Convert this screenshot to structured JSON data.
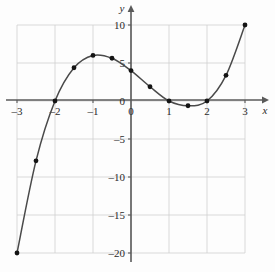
{
  "chart_data": {
    "type": "line",
    "title": "",
    "subtitle": "",
    "xlabel": "x",
    "ylabel": "y",
    "xlim": [
      -3,
      3
    ],
    "ylim": [
      -20,
      10
    ],
    "grid": true,
    "legend": false,
    "legend_position": "none",
    "x_ticks": [
      -3,
      -2,
      -1,
      0,
      1,
      2,
      3
    ],
    "x_tick_labels": [
      "–3",
      "–2",
      "–1",
      "0",
      "1",
      "2",
      "3"
    ],
    "y_ticks": [
      10,
      5,
      0,
      -5,
      -10,
      -15,
      -20
    ],
    "y_tick_labels": [
      "10",
      "5",
      "0",
      "–5",
      "–10",
      "–15",
      "–20"
    ],
    "y_zero_label_hidden": false,
    "x_gridlines": [
      -3,
      -2,
      -1,
      0,
      1,
      2,
      3
    ],
    "y_gridlines": [
      10,
      5,
      0,
      -5,
      -10,
      -15,
      -20
    ],
    "series": [
      {
        "name": "cubic-curve",
        "type": "line",
        "color": "#4a4a4a",
        "marker": "circle",
        "marker_color": "#141414",
        "x": [
          -3,
          -2.5,
          -2,
          -1.5,
          -1,
          -0.5,
          0,
          0.5,
          1,
          1.5,
          2,
          2.5,
          3
        ],
        "y": [
          -20,
          -7.875,
          0,
          4.375,
          6,
          5.625,
          4,
          1.875,
          0,
          -0.625,
          0,
          3.375,
          10
        ]
      }
    ],
    "marked_points": [
      {
        "x": -3,
        "y": -20
      },
      {
        "x": -2.5,
        "y": -7.875
      },
      {
        "x": -2,
        "y": 0
      },
      {
        "x": -1.5,
        "y": 4.375
      },
      {
        "x": -1,
        "y": 6
      },
      {
        "x": -0.5,
        "y": 5.625
      },
      {
        "x": 0,
        "y": 4
      },
      {
        "x": 0.5,
        "y": 1.875
      },
      {
        "x": 1,
        "y": 0
      },
      {
        "x": 1.5,
        "y": -0.625
      },
      {
        "x": 2,
        "y": 0
      },
      {
        "x": 2.5,
        "y": 3.375
      },
      {
        "x": 3,
        "y": 10
      }
    ],
    "annotations": []
  },
  "style": {
    "background": "#fdfdfd",
    "grid_color": "#cfcfcf",
    "axis_color": "#5a5a5a",
    "curve_color": "#4a4a4a",
    "point_color": "#141414",
    "text_color": "#2b2b2b"
  }
}
